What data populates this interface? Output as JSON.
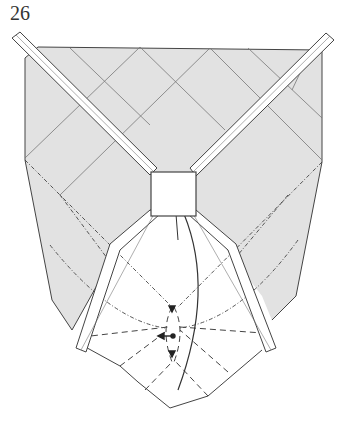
{
  "step": {
    "number": "26"
  },
  "diagram": {
    "type": "origami-fold-diagram",
    "colors": {
      "paper_colored": "#e2e2e2",
      "paper_white": "#ffffff",
      "line": "#444444"
    },
    "elements": [
      "colored-top-region",
      "left-diagonal-strip",
      "right-diagonal-strip",
      "center-square",
      "lower-left-strip",
      "lower-right-strip",
      "white-bottom-flap",
      "valley-fold-lines",
      "mountain-fold-lines",
      "action-arrow",
      "push-arrow"
    ]
  }
}
